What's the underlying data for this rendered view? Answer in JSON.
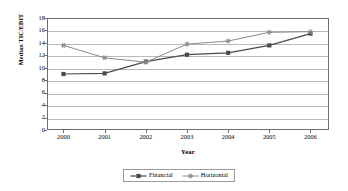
{
  "chart_data": {
    "type": "line",
    "title": "",
    "xlabel": "Year",
    "ylabel": "Median TIC/EBIT",
    "categories": [
      "2000",
      "2001",
      "2002",
      "2003",
      "2004",
      "2005",
      "2006"
    ],
    "x": [
      2000,
      2001,
      2002,
      2003,
      2004,
      2005,
      2006
    ],
    "xlim": [
      1999.6,
      2006.45
    ],
    "ylim": [
      0,
      18
    ],
    "yticks": [
      0,
      2,
      4,
      6,
      8,
      10,
      12,
      14,
      16,
      18
    ],
    "grid": true,
    "legend_position": "bottom-center",
    "series": [
      {
        "name": "Financial",
        "marker": "square",
        "color": "#4a4a4a",
        "values": [
          9.0,
          9.1,
          11.0,
          12.1,
          12.4,
          13.6,
          15.5
        ]
      },
      {
        "name": "Horizontal",
        "marker": "star",
        "color": "#8a8a8a",
        "values": [
          13.6,
          11.6,
          10.9,
          13.8,
          14.3,
          15.7,
          15.8
        ]
      }
    ]
  },
  "axes": {
    "y_tick_labels": [
      "18",
      "16",
      "14",
      "12",
      "10",
      "8",
      "6",
      "4",
      "2",
      "0"
    ],
    "x_tick_labels": [
      "2000",
      "2001",
      "2002",
      "2003",
      "2004",
      "2005",
      "2006"
    ],
    "x_title": "Year",
    "y_title": "Median TIC/EBIT"
  },
  "legend": {
    "entries": [
      {
        "label": "Financial",
        "marker": "square-marker-icon",
        "color": "#4a4a4a"
      },
      {
        "label": "Horizontal",
        "marker": "star-marker-icon",
        "color": "#8a8a8a"
      }
    ]
  },
  "colors": {
    "frame": "#6e6e6e",
    "gridline": "#b8b8b8",
    "series_financial": "#4a4a4a",
    "series_horizontal": "#8a8a8a",
    "background": "#ffffff",
    "text": "#000000"
  }
}
